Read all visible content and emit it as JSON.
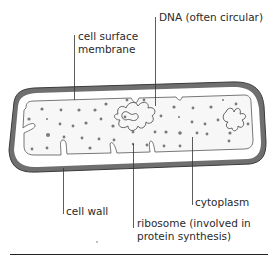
{
  "diagram": {
    "colors": {
      "cell_wall": "#6f6f6f",
      "cell_wall_outline": "#3a3a3a",
      "cytoplasm_fill": "#f7f7f7",
      "membrane_stroke": "#555555",
      "ribosome": "#7a7a7a",
      "leader_line": "#333333",
      "text": "#2a2a2a",
      "rule": "#222222"
    },
    "labels": {
      "dna": "DNA (often circular)",
      "membrane_line1": "cell surface",
      "membrane_line2": "membrane",
      "cytoplasm": "cytoplasm",
      "cell_wall": "cell wall",
      "ribosome_line1": "ribosome (involved in",
      "ribosome_line2": "protein synthesis)"
    }
  }
}
